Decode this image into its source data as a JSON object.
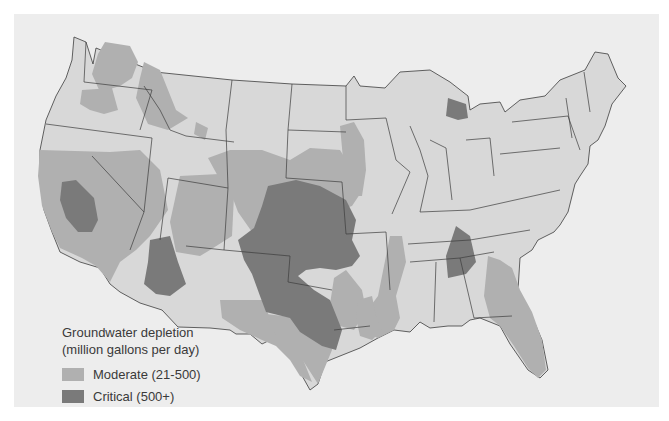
{
  "map": {
    "subject": "Groundwater depletion in the contiguous United States",
    "colors": {
      "background": "#ededed",
      "land": "#d8d8d8",
      "moderate": "#b0b0b0",
      "critical": "#7a7a7a",
      "border": "#3c3c3c"
    }
  },
  "legend": {
    "title_line1": "Groundwater depletion",
    "title_line2": "(million gallons per day)",
    "items": [
      {
        "label": "Moderate (21-500)",
        "color": "#b0b0b0"
      },
      {
        "label": "Critical (500+)",
        "color": "#7a7a7a"
      }
    ]
  }
}
